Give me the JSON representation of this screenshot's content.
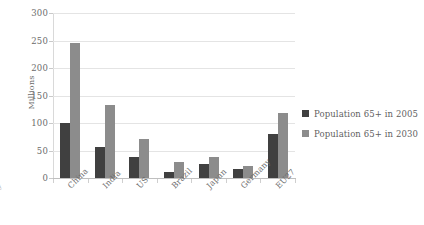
{
  "chart_data": {
    "type": "bar",
    "title": "",
    "xlabel": "",
    "ylabel": "Millions",
    "ylim": [
      0,
      300
    ],
    "yticks": [
      0,
      50,
      100,
      150,
      200,
      250,
      300
    ],
    "grid": true,
    "legend_position": "right",
    "categories": [
      "China",
      "India",
      "US",
      "Brazil",
      "Japan",
      "Germany",
      "EU27"
    ],
    "series": [
      {
        "name": "Population 65+ in 2005",
        "color": "#404040",
        "values": [
          100,
          57,
          38,
          11,
          25,
          16,
          80
        ]
      },
      {
        "name": "Population 65+ in 2030",
        "color": "#8c8c8c",
        "values": [
          245,
          132,
          71,
          29,
          38,
          22,
          118
        ]
      }
    ],
    "clipped_left_label": "y"
  },
  "axis": {
    "y_title": "Millions",
    "y_ticks": [
      "300",
      "250",
      "200",
      "150",
      "100",
      "50",
      "0"
    ]
  },
  "legend": {
    "items": [
      {
        "label": "Population 65+ in 2005",
        "swatch": "dark-gray-swatch"
      },
      {
        "label": "Population 65+ in 2030",
        "swatch": "light-gray-swatch"
      }
    ]
  },
  "colors": {
    "series_2005": "#404040",
    "series_2030": "#8c8c8c",
    "gridline": "#e4e4e4",
    "axis_line": "#bfbfbf",
    "text": "#6b6b6b",
    "background": "#ffffff"
  }
}
